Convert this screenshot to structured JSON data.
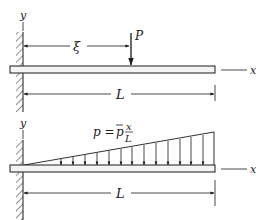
{
  "figure": {
    "top": {
      "description": "Cantilever beam with concentrated load P at distance xi from the fixed end",
      "labels": {
        "y_axis": "y",
        "x_axis": "x",
        "load": "P",
        "load_position": "ξ",
        "length": "L"
      }
    },
    "bottom": {
      "description": "Cantilever beam with linearly increasing distributed load",
      "labels": {
        "y_axis": "y",
        "x_axis": "x",
        "length": "L",
        "formula_lhs": "p = ",
        "formula_pbar": "p",
        "formula_num": "x",
        "formula_den": "L"
      },
      "arrow_count": 13
    },
    "colors": {
      "ink": "#1a1a1a",
      "beam_fill": "#f4f4f4",
      "background": "#ffffff"
    }
  }
}
